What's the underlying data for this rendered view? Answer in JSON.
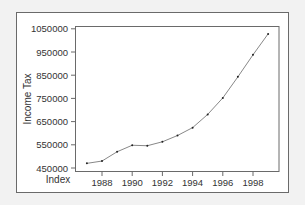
{
  "chart_data": {
    "type": "line",
    "title": "",
    "xlabel": "Index",
    "ylabel": "Income Tax",
    "x": [
      1987,
      1988,
      1989,
      1990,
      1991,
      1992,
      1993,
      1994,
      1995,
      1996,
      1997,
      1998,
      1999
    ],
    "series": [
      {
        "name": "Income Tax",
        "values": [
          470000,
          480000,
          520000,
          548000,
          546000,
          563000,
          590000,
          624000,
          681000,
          752000,
          843000,
          938000,
          1028000
        ]
      }
    ],
    "x_ticks": [
      "1988",
      "1990",
      "1992",
      "1994",
      "1996",
      "1998"
    ],
    "y_ticks": [
      "450000",
      "550000",
      "650000",
      "750000",
      "850000",
      "950000",
      "1050000"
    ],
    "xlim": [
      1986.1,
      1999.7
    ],
    "ylim": [
      445000,
      1060000
    ],
    "grid": false,
    "legend": "none",
    "colors": {
      "line": "#888888",
      "marker": "#222222",
      "axis": "#6a6a6a",
      "background": "#f2f2f2",
      "panel": "#ffffff"
    }
  }
}
